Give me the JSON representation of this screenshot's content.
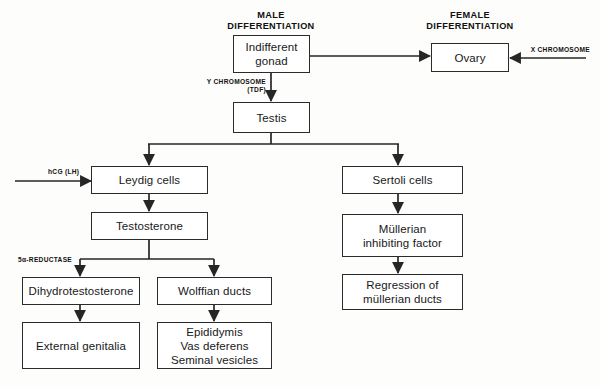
{
  "diagram": {
    "headers": [
      {
        "id": "male-differentiation",
        "text": "MALE\nDIFFERENTIATION"
      },
      {
        "id": "female-differentiation",
        "text": "FEMALE\nDIFFERENTIATION"
      }
    ],
    "nodes": [
      {
        "id": "indifferent-gonad",
        "label": "Indifferent\ngonad"
      },
      {
        "id": "ovary",
        "label": "Ovary"
      },
      {
        "id": "testis",
        "label": "Testis"
      },
      {
        "id": "leydig-cells",
        "label": "Leydig cells"
      },
      {
        "id": "sertoli-cells",
        "label": "Sertoli cells"
      },
      {
        "id": "testosterone",
        "label": "Testosterone"
      },
      {
        "id": "mullerian-inhibiting-factor",
        "label": "Müllerian\ninhibiting factor"
      },
      {
        "id": "dihydrotestosterone",
        "label": "Dihydrotestosterone"
      },
      {
        "id": "wolffian-ducts",
        "label": "Wolffian ducts"
      },
      {
        "id": "regression-mullerian-ducts",
        "label": "Regression of\nmüllerian ducts"
      },
      {
        "id": "external-genitalia",
        "label": "External genitalia"
      },
      {
        "id": "male-ducts",
        "label": "Epididymis\nVas deferens\nSeminal vesicles"
      }
    ],
    "edge_labels": [
      {
        "id": "x-chromosome",
        "text": "X CHROMOSOME"
      },
      {
        "id": "y-chromosome",
        "text": "Y CHROMOSOME\n(TDF)"
      },
      {
        "id": "hcg-lh",
        "text": "hCG (LH)"
      },
      {
        "id": "5-alpha-reductase",
        "text": "5α-REDUCTASE"
      }
    ],
    "colors": {
      "line": "#262626",
      "box_border": "#2b2b2b",
      "box_fill": "#ffffff",
      "background": "#fdfdfb",
      "text": "#181818"
    }
  }
}
